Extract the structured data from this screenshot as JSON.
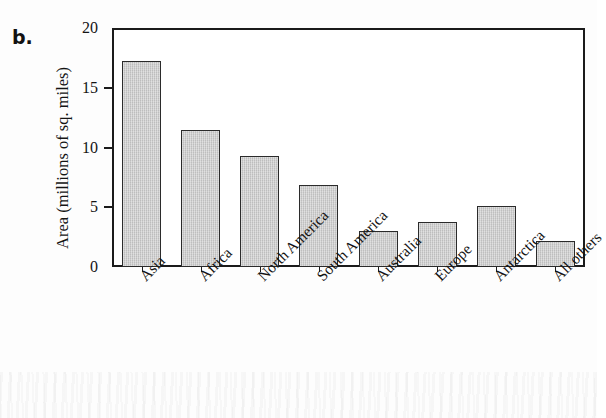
{
  "figure": {
    "panel_letter": "b."
  },
  "chart_data": {
    "type": "bar",
    "title": "",
    "xlabel": "",
    "ylabel": "Area (millions of sq. miles)",
    "categories": [
      "Asia",
      "Africa",
      "North America",
      "South America",
      "Australia",
      "Europe",
      "Antarctica",
      "All others"
    ],
    "values": [
      17.2,
      11.5,
      9.3,
      6.9,
      3.0,
      3.8,
      5.1,
      2.2
    ],
    "ylim": [
      0,
      20
    ],
    "yticks": [
      0,
      5,
      10,
      15,
      20
    ],
    "ytick_labels": [
      "0",
      "5",
      "10",
      "15",
      "20"
    ],
    "grid": false,
    "legend": false,
    "bar_fill_color": "#c9c9c9",
    "bar_border_color": "#2b2b2b",
    "axis_color": "#1b1b1b"
  }
}
